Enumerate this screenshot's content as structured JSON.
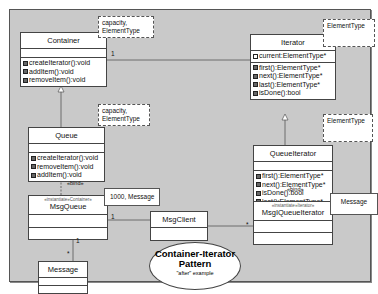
{
  "diagram": {
    "title_line1": "Container-Iterator",
    "title_line2": "Pattern",
    "subtitle": "\"after\" example"
  },
  "classes": {
    "container": {
      "name": "Container",
      "template_params": [
        "capacity,",
        "ElementType"
      ],
      "operations": [
        "createIterator():void",
        "addItem():void",
        "removeItem():void"
      ]
    },
    "iterator": {
      "name": "Iterator",
      "template_params": [
        "ElementType"
      ],
      "attributes": [
        "current:ElementType*"
      ],
      "operations": [
        "first():ElementType*",
        "next():ElementType*",
        "last():ElementType*",
        "isDone():bool"
      ]
    },
    "queue": {
      "name": "Queue",
      "template_params": [
        "capacity,",
        "ElementType"
      ],
      "operations": [
        "createIterator():void",
        "removeItem():void",
        "addItem():void"
      ]
    },
    "queue_iterator": {
      "name": "QueueIterator",
      "template_params": [
        "ElementType"
      ],
      "operations": [
        "first():ElementType*",
        "next():ElementType*",
        "isDone():bool",
        "last():ElementType*"
      ]
    },
    "msg_queue": {
      "name": "MsgQueue",
      "stereotype": "«instantiate»Container»",
      "bind_params": "1000, Message"
    },
    "msg_client": {
      "name": "MsgClient"
    },
    "msg_queue_iterator": {
      "name": "MsgIQueueIterator",
      "stereotype": "«instantiate»Iterator»",
      "bind_params": "Message"
    },
    "message": {
      "name": "Message"
    }
  },
  "relations": {
    "container_iterator_mult": "1",
    "queue_bind": "«bind»",
    "queueiter_bind": "«bind»",
    "client_msgqueue_mult": "1",
    "client_iter_mult": "*",
    "msgqueue_message_mult_top": "1",
    "msgqueue_message_mult_bottom": "*"
  }
}
